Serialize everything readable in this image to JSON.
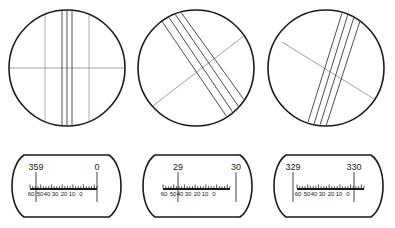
{
  "figure": {
    "stroke_color": "#1a1a1a",
    "line_color": "#555555",
    "background": "#ffffff",
    "views": [
      {
        "id": "view-1",
        "name": "reticle-view-left",
        "center_x": 67,
        "center_y": 68,
        "radius": 58,
        "graduation_style": "vertical",
        "lines": [
          {
            "name": "horizontal-hairline",
            "x1": 9,
            "y1": 68,
            "x2": 125,
            "y2": 68,
            "weight": 0.7,
            "shade": "#777777"
          },
          {
            "name": "graduation-line-1",
            "x1": 45,
            "y1": 11,
            "x2": 45,
            "y2": 125,
            "weight": 0.7,
            "shade": "#8a8a8a"
          },
          {
            "name": "graduation-line-2",
            "x1": 62,
            "y1": 10,
            "x2": 62,
            "y2": 126,
            "weight": 0.9,
            "shade": "#3a3a3a"
          },
          {
            "name": "graduation-line-3",
            "x1": 67,
            "y1": 10,
            "x2": 67,
            "y2": 126,
            "weight": 0.9,
            "shade": "#3a3a3a"
          },
          {
            "name": "graduation-line-4",
            "x1": 72,
            "y1": 10,
            "x2": 72,
            "y2": 126,
            "weight": 0.9,
            "shade": "#3a3a3a"
          },
          {
            "name": "graduation-line-5",
            "x1": 89,
            "y1": 11,
            "x2": 89,
            "y2": 125,
            "weight": 0.7,
            "shade": "#8a8a8a"
          }
        ]
      },
      {
        "id": "view-2",
        "name": "reticle-view-center",
        "center_x": 196,
        "center_y": 68,
        "radius": 58,
        "graduation_style": "inclined",
        "lines": [
          {
            "name": "index-diagonal-line",
            "x1": 150,
            "y1": 108,
            "x2": 249,
            "y2": 32,
            "weight": 0.7,
            "shade": "#777777"
          },
          {
            "name": "graduation-line-1",
            "x1": 159,
            "y1": 17,
            "x2": 229,
            "y2": 120,
            "weight": 0.9,
            "shade": "#3a3a3a"
          },
          {
            "name": "graduation-line-2",
            "x1": 166,
            "y1": 13,
            "x2": 236,
            "y2": 117,
            "weight": 0.9,
            "shade": "#3a3a3a"
          },
          {
            "name": "graduation-line-3",
            "x1": 173,
            "y1": 11,
            "x2": 243,
            "y2": 113,
            "weight": 0.9,
            "shade": "#3a3a3a"
          },
          {
            "name": "graduation-line-4",
            "x1": 180,
            "y1": 11,
            "x2": 250,
            "y2": 108,
            "weight": 0.9,
            "shade": "#3a3a3a"
          }
        ]
      },
      {
        "id": "view-3",
        "name": "reticle-view-right",
        "center_x": 326,
        "center_y": 68,
        "radius": 58,
        "graduation_style": "inclined-steep",
        "lines": [
          {
            "name": "index-diagonal-line",
            "x1": 282,
            "y1": 42,
            "x2": 374,
            "y2": 99,
            "weight": 0.7,
            "shade": "#777777"
          },
          {
            "name": "graduation-line-1",
            "x1": 308,
            "y1": 122,
            "x2": 342,
            "y2": 13,
            "weight": 0.9,
            "shade": "#3a3a3a"
          },
          {
            "name": "graduation-line-2",
            "x1": 314,
            "y1": 124,
            "x2": 348,
            "y2": 14,
            "weight": 0.9,
            "shade": "#3a3a3a"
          },
          {
            "name": "graduation-line-3",
            "x1": 320,
            "y1": 125,
            "x2": 354,
            "y2": 17,
            "weight": 0.9,
            "shade": "#3a3a3a"
          },
          {
            "name": "graduation-line-4",
            "x1": 326,
            "y1": 126,
            "x2": 360,
            "y2": 21,
            "weight": 0.9,
            "shade": "#3a3a3a"
          }
        ]
      }
    ],
    "readouts": [
      {
        "id": "readout-1",
        "name": "micrometer-readout-left",
        "box": {
          "x": 10,
          "y": 155,
          "width": 113,
          "height": 62
        },
        "left_value": "359",
        "right_value": "0",
        "left_pointer_x": 36,
        "right_pointer_x": 97,
        "pointer_top_y": 172,
        "pointer_bottom_y": 202,
        "scale": {
          "x": 30,
          "y": 189,
          "width": 67,
          "ticks": 25,
          "labels": [
            "60",
            "50",
            "40",
            "30",
            "20",
            "10",
            "0"
          ],
          "label_positions": [
            31,
            40,
            47,
            55,
            64,
            72,
            81
          ]
        }
      },
      {
        "id": "readout-2",
        "name": "micrometer-readout-center",
        "box": {
          "x": 141,
          "y": 155,
          "width": 113,
          "height": 62
        },
        "left_value": "29",
        "right_value": "30",
        "left_pointer_x": 178,
        "right_pointer_x": 236,
        "pointer_top_y": 172,
        "pointer_bottom_y": 202,
        "scale": {
          "x": 163,
          "y": 189,
          "width": 67,
          "ticks": 25,
          "labels": [
            "60",
            "50",
            "40",
            "30",
            "20",
            "10",
            "0"
          ],
          "label_positions": [
            164,
            173,
            180,
            188,
            197,
            205,
            214
          ]
        }
      },
      {
        "id": "readout-3",
        "name": "micrometer-readout-right",
        "box": {
          "x": 272,
          "y": 155,
          "width": 113,
          "height": 62
        },
        "left_value": "329",
        "right_value": "330",
        "left_pointer_x": 293,
        "right_pointer_x": 354,
        "pointer_top_y": 172,
        "pointer_bottom_y": 202,
        "scale": {
          "x": 297,
          "y": 189,
          "width": 67,
          "ticks": 25,
          "labels": [
            "60",
            "50",
            "40",
            "30",
            "20",
            "10",
            "0"
          ],
          "label_positions": [
            298,
            307,
            314,
            322,
            331,
            339,
            348
          ]
        }
      }
    ]
  }
}
